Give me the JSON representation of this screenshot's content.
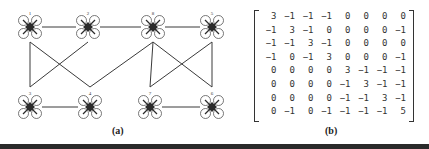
{
  "figure": {
    "panel_a": {
      "caption": "(a)",
      "nodes": [
        {
          "id": "1",
          "label": "1",
          "x": 30,
          "y": 27
        },
        {
          "id": "2",
          "label": "2",
          "x": 88,
          "y": 27
        },
        {
          "id": "8",
          "label": "8",
          "x": 153,
          "y": 27
        },
        {
          "id": "5",
          "label": "5",
          "x": 212,
          "y": 27
        },
        {
          "id": "3",
          "label": "3",
          "x": 30,
          "y": 107
        },
        {
          "id": "4",
          "label": "4",
          "x": 90,
          "y": 107
        },
        {
          "id": "7",
          "label": "7",
          "x": 150,
          "y": 107
        },
        {
          "id": "6",
          "label": "6",
          "x": 212,
          "y": 107
        }
      ],
      "edges": [
        [
          "1",
          "2"
        ],
        [
          "2",
          "8"
        ],
        [
          "8",
          "5"
        ],
        [
          "3",
          "4"
        ],
        [
          "7",
          "6"
        ],
        [
          "1",
          "3"
        ],
        [
          "1",
          "4"
        ],
        [
          "2",
          "3"
        ],
        [
          "4",
          "8"
        ],
        [
          "8",
          "7"
        ],
        [
          "8",
          "6"
        ],
        [
          "5",
          "7"
        ],
        [
          "5",
          "6"
        ]
      ]
    },
    "panel_b": {
      "caption": "(b)",
      "matrix": [
        [
          "3",
          "−1",
          "−1",
          "−1",
          "0",
          "0",
          "0",
          "0"
        ],
        [
          "−1",
          "3",
          "−1",
          "0",
          "0",
          "0",
          "0",
          "−1"
        ],
        [
          "−1",
          "−1",
          "3",
          "−1",
          "0",
          "0",
          "0",
          "0"
        ],
        [
          "−1",
          "0",
          "−1",
          "3",
          "0",
          "0",
          "0",
          "−1"
        ],
        [
          "0",
          "0",
          "0",
          "0",
          "3",
          "−1",
          "−1",
          "−1"
        ],
        [
          "0",
          "0",
          "0",
          "0",
          "−1",
          "3",
          "−1",
          "−1"
        ],
        [
          "0",
          "0",
          "0",
          "0",
          "−1",
          "−1",
          "3",
          "−1"
        ],
        [
          "0",
          "−1",
          "0",
          "−1",
          "−1",
          "−1",
          "−1",
          "5"
        ]
      ]
    },
    "colors": {
      "edge": "#3a3a3a",
      "drone_body": "#2b2b2b",
      "rotor": "#555555",
      "bottom_bar": "#2a2a2a"
    }
  }
}
